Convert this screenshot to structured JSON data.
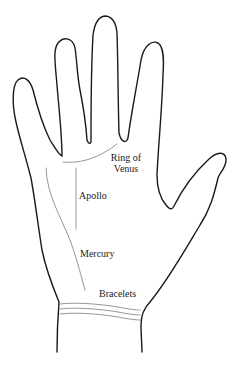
{
  "diagram": {
    "labels": {
      "ring_of_venus_line1": "Ring of",
      "ring_of_venus_line2": "Venus",
      "apollo": "Apollo",
      "mercury": "Mercury",
      "bracelets": "Bracelets"
    },
    "colors": {
      "outline": "#1a1a1a",
      "palm_lines": "#8a8a8a",
      "text": "#222222",
      "background": "#ffffff"
    }
  }
}
